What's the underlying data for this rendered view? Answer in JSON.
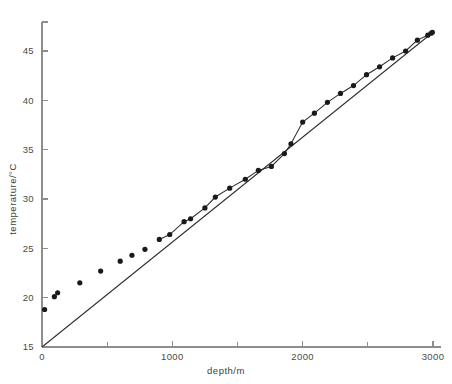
{
  "figure": {
    "background": "#ffffff",
    "ink_color": "#2e2e2e",
    "point_color": "#1a1a1a",
    "axis_color": "#8d8d8d"
  },
  "labels": {
    "x_axis_title": "depth/m",
    "y_axis_title": "temperature/°C"
  },
  "chart_data": {
    "type": "scatter",
    "title": "",
    "xlabel": "depth/m",
    "ylabel": "temperature/°C",
    "xlim": [
      0,
      3050
    ],
    "ylim": [
      15,
      48
    ],
    "grid": false,
    "legend": "none",
    "x_ticks_major": [
      0,
      1000,
      2000,
      3000
    ],
    "x_tick_labels": [
      "0",
      "1000",
      "2000",
      "3000"
    ],
    "x_ticks_minor": [
      500,
      1500,
      2500
    ],
    "y_ticks_major": [
      15,
      20,
      25,
      30,
      35,
      40,
      45
    ],
    "y_tick_labels": [
      "15",
      "20",
      "25",
      "30",
      "35",
      "40",
      "45"
    ],
    "series": [
      {
        "name": "measured temperature",
        "marker": "filled-circle",
        "connected_from_x": 900,
        "x": [
          20,
          95,
          120,
          290,
          450,
          600,
          690,
          790,
          900,
          980,
          1090,
          1140,
          1250,
          1330,
          1440,
          1560,
          1660,
          1760,
          1860,
          1910,
          2000,
          2090,
          2190,
          2290,
          2390,
          2490,
          2590,
          2690,
          2790,
          2880,
          2960,
          2985,
          2995
        ],
        "y": [
          18.8,
          20.1,
          20.5,
          21.5,
          22.7,
          23.7,
          24.3,
          24.9,
          25.9,
          26.4,
          27.7,
          28.0,
          29.1,
          30.2,
          31.1,
          32.0,
          32.9,
          33.3,
          34.6,
          35.6,
          37.8,
          38.7,
          39.8,
          40.7,
          41.5,
          42.6,
          43.4,
          44.3,
          45.0,
          46.1,
          46.6,
          46.8,
          46.9
        ]
      }
    ],
    "reference_line": {
      "name": "linear gradient reference",
      "from": [
        0,
        15
      ],
      "to": [
        3000,
        46.9
      ]
    }
  }
}
